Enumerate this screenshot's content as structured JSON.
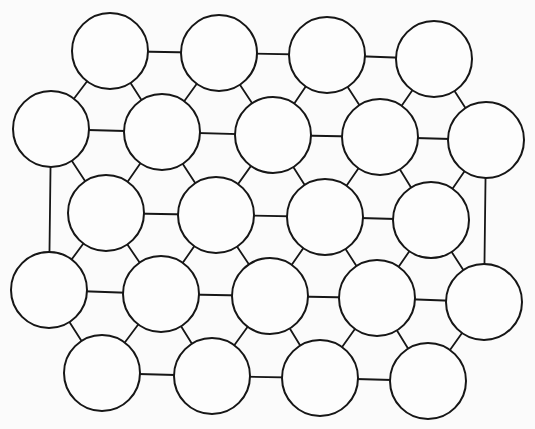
{
  "diagram": {
    "title": "",
    "colors": {
      "background": "#fbfbfb",
      "stroke": "#161616",
      "fill": "#fdfdfd"
    },
    "radius": 38,
    "nodes": [
      {
        "id": "A",
        "x": 110,
        "y": 51
      },
      {
        "id": "B",
        "x": 219,
        "y": 53
      },
      {
        "id": "C",
        "x": 327,
        "y": 55
      },
      {
        "id": "D",
        "x": 434,
        "y": 59
      },
      {
        "id": "E",
        "x": 51,
        "y": 129
      },
      {
        "id": "F",
        "x": 162,
        "y": 132
      },
      {
        "id": "G",
        "x": 273,
        "y": 135
      },
      {
        "id": "H",
        "x": 380,
        "y": 137
      },
      {
        "id": "I",
        "x": 486,
        "y": 140
      },
      {
        "id": "J",
        "x": 106,
        "y": 213
      },
      {
        "id": "K",
        "x": 216,
        "y": 215
      },
      {
        "id": "L",
        "x": 325,
        "y": 217
      },
      {
        "id": "M",
        "x": 431,
        "y": 220
      },
      {
        "id": "N",
        "x": 49,
        "y": 290
      },
      {
        "id": "O",
        "x": 161,
        "y": 294
      },
      {
        "id": "P",
        "x": 270,
        "y": 296
      },
      {
        "id": "Q",
        "x": 377,
        "y": 298
      },
      {
        "id": "R",
        "x": 484,
        "y": 302
      },
      {
        "id": "S",
        "x": 102,
        "y": 373
      },
      {
        "id": "T",
        "x": 212,
        "y": 376
      },
      {
        "id": "U",
        "x": 320,
        "y": 378
      },
      {
        "id": "V",
        "x": 428,
        "y": 381
      }
    ],
    "edges": [
      [
        "A",
        "B"
      ],
      [
        "B",
        "C"
      ],
      [
        "C",
        "D"
      ],
      [
        "A",
        "E"
      ],
      [
        "A",
        "F"
      ],
      [
        "B",
        "F"
      ],
      [
        "B",
        "G"
      ],
      [
        "C",
        "G"
      ],
      [
        "C",
        "H"
      ],
      [
        "D",
        "H"
      ],
      [
        "D",
        "I"
      ],
      [
        "E",
        "F"
      ],
      [
        "F",
        "G"
      ],
      [
        "G",
        "H"
      ],
      [
        "H",
        "I"
      ],
      [
        "E",
        "J"
      ],
      [
        "F",
        "J"
      ],
      [
        "F",
        "K"
      ],
      [
        "G",
        "K"
      ],
      [
        "G",
        "L"
      ],
      [
        "H",
        "L"
      ],
      [
        "H",
        "M"
      ],
      [
        "I",
        "M"
      ],
      [
        "J",
        "K"
      ],
      [
        "K",
        "L"
      ],
      [
        "L",
        "M"
      ],
      [
        "E",
        "N"
      ],
      [
        "I",
        "R"
      ],
      [
        "J",
        "N"
      ],
      [
        "J",
        "O"
      ],
      [
        "K",
        "O"
      ],
      [
        "K",
        "P"
      ],
      [
        "L",
        "P"
      ],
      [
        "L",
        "Q"
      ],
      [
        "M",
        "Q"
      ],
      [
        "M",
        "R"
      ],
      [
        "N",
        "O"
      ],
      [
        "O",
        "P"
      ],
      [
        "P",
        "Q"
      ],
      [
        "Q",
        "R"
      ],
      [
        "N",
        "S"
      ],
      [
        "O",
        "S"
      ],
      [
        "O",
        "T"
      ],
      [
        "P",
        "T"
      ],
      [
        "P",
        "U"
      ],
      [
        "Q",
        "U"
      ],
      [
        "Q",
        "V"
      ],
      [
        "R",
        "V"
      ],
      [
        "S",
        "T"
      ],
      [
        "T",
        "U"
      ],
      [
        "U",
        "V"
      ]
    ]
  }
}
